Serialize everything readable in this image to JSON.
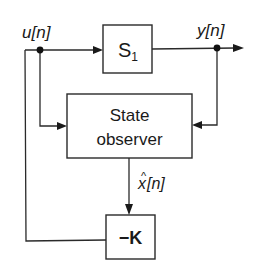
{
  "diagram": {
    "type": "block-diagram",
    "signals": {
      "input": {
        "label": "u[n]"
      },
      "output": {
        "label": "y[n]"
      },
      "estimate": {
        "label_base": "x",
        "label_hat": "^",
        "label_index": "[n]"
      }
    },
    "blocks": {
      "plant": {
        "label": "S",
        "subscript": "1"
      },
      "observer": {
        "line1": "State",
        "line2": "observer"
      },
      "gain": {
        "label": "−K"
      }
    },
    "connections": [
      {
        "from": "u[n]",
        "to": "S1"
      },
      {
        "from": "S1",
        "to": "y[n]"
      },
      {
        "from": "u[n]",
        "to": "State observer"
      },
      {
        "from": "y[n]",
        "to": "State observer"
      },
      {
        "from": "State observer",
        "to": "−K",
        "signal": "x̂[n]"
      },
      {
        "from": "−K",
        "to": "u[n]"
      }
    ],
    "colors": {
      "ink": "#1a1a1a",
      "background": "#ffffff"
    }
  }
}
